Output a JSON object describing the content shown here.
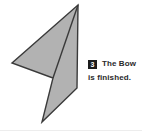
{
  "figure": {
    "alt_name": "origami-bow-step-figure",
    "shape_fill": "#b2b2b2",
    "shape_stroke": "#3a3a3a",
    "fold_line_color": "#3a3a3a",
    "background": "#ffffff"
  },
  "caption": {
    "step_number": "3",
    "line_1": "The Bow",
    "line_2": "is finished.",
    "text_color": "#2a2a2a",
    "badge_background": "#1c1c1c",
    "badge_text_color": "#ffffff"
  },
  "diagram_data": {
    "type": "diagram",
    "title": "The Bow is finished.",
    "step": 3,
    "outline_points": [
      [
        78,
        5
      ],
      [
        77,
        88
      ],
      [
        42,
        122
      ],
      [
        53,
        78
      ],
      [
        12,
        63
      ]
    ],
    "fold_lines": [
      [
        [
          78,
          5
        ],
        [
          53,
          78
        ]
      ]
    ]
  }
}
